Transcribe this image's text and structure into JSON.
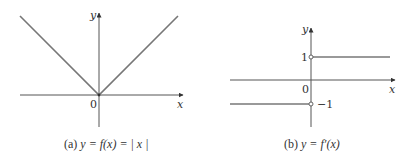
{
  "figures": [
    {
      "id": "a",
      "caption_prefix": "(a) ",
      "caption_math": "y = f(x) = | x |",
      "axis_x_label": "x",
      "axis_y_label": "y",
      "origin_label": "0",
      "function": "absolute value",
      "description": "V-shaped graph with vertex at the origin"
    },
    {
      "id": "b",
      "caption_prefix": "(b) ",
      "caption_math": "y = f′(x)",
      "axis_x_label": "x",
      "axis_y_label": "y",
      "origin_label": "0",
      "tick_pos_label": "1",
      "tick_neg_label": "−1",
      "function": "derivative of absolute value",
      "description": "Step function: y = 1 for x > 0, y = −1 for x < 0, open circles at x = 0"
    }
  ],
  "colors": {
    "axis": "#555555",
    "curve": "#777777",
    "text": "#333333"
  }
}
